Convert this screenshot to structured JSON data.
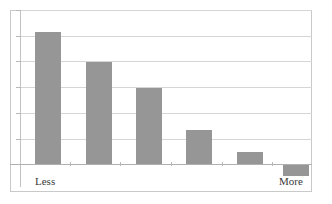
{
  "chart_data": {
    "type": "bar",
    "title": "",
    "subtitle": "",
    "xlabel": "",
    "ylabel": "",
    "categories": [
      "1",
      "2",
      "3",
      "4",
      "5",
      "6"
    ],
    "values": [
      6,
      5,
      4,
      1.8,
      0.7,
      0
    ],
    "ylim": [
      0,
      6
    ],
    "xlim": [
      0,
      6
    ],
    "grid": true,
    "gridlines": [
      0,
      1,
      2,
      3,
      4,
      5,
      6
    ],
    "legend": null,
    "legend_position": "none",
    "bar_color": "#969696",
    "gridline_color": "#d5d5d5",
    "frame_color": "#c9c9c9",
    "axis_color": "#b0b0b0",
    "tick_labels_x": [
      "Less",
      "",
      "",
      "",
      "",
      "More"
    ],
    "tick_labels_y": [],
    "annotations": [
      {
        "text": "Less",
        "position": "below-axis-left"
      },
      {
        "text": "More",
        "position": "below-axis-right"
      }
    ]
  },
  "axis": {
    "label_left": "Less",
    "label_right": "More"
  },
  "bars": [
    {
      "name": "bar-1",
      "value": 6,
      "left": 35,
      "top": 32,
      "width": 26,
      "height": 132
    },
    {
      "name": "bar-2",
      "value": 5,
      "left": 86,
      "top": 62,
      "width": 26,
      "height": 102
    },
    {
      "name": "bar-3",
      "value": 4,
      "left": 136,
      "top": 88,
      "width": 26,
      "height": 76
    },
    {
      "name": "bar-4",
      "value": 1.8,
      "left": 186,
      "top": 130,
      "width": 26,
      "height": 34
    },
    {
      "name": "bar-5",
      "value": 0.7,
      "left": 237,
      "top": 152,
      "width": 26,
      "height": 12
    },
    {
      "name": "bar-6",
      "value": 0,
      "left": 283,
      "top": 165,
      "width": 26,
      "height": 11
    }
  ],
  "gridlines_y": [
    10,
    35.7,
    61.4,
    87.1,
    112.8,
    138.5
  ],
  "x_ticks": [
    70,
    120,
    171,
    222,
    272
  ]
}
